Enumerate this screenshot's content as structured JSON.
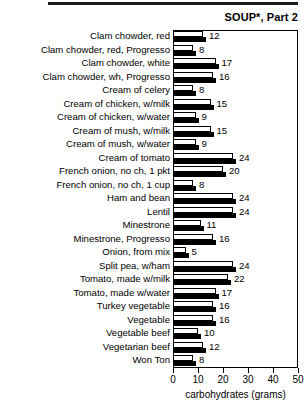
{
  "chart_title": "SOUP*, Part 2",
  "axis": {
    "x_title": "carbohydrates (grams)",
    "ticks": [
      {
        "value": 0,
        "label": "0"
      },
      {
        "value": 10,
        "label": "10"
      },
      {
        "value": 20,
        "label": "20"
      },
      {
        "value": 30,
        "label": "30"
      },
      {
        "value": 40,
        "label": "40"
      },
      {
        "value": 50,
        "label": "50"
      }
    ]
  },
  "chart_data": {
    "type": "bar",
    "orientation": "horizontal",
    "title": "SOUP*, Part 2",
    "xlabel": "carbohydrates (grams)",
    "ylabel": "",
    "xlim": [
      0,
      50
    ],
    "grid": false,
    "legend": null,
    "categories": [
      "Clam chowder, red",
      "Clam chowder, red, Progresso",
      "Clam chowder, white",
      "Clam chowder, wh, Progresso",
      "Cream of celery",
      "Cream of chicken, w/milk",
      "Cream of chicken, w/water",
      "Cream of mush, w/milk",
      "Cream of mush, w/water",
      "Cream of tomato",
      "French onion, no ch, 1 pkt",
      "French onion, no ch, 1 cup",
      "Ham and bean",
      "Lentil",
      "Minestrone",
      "Minestrone, Progresso",
      "Onion, from mix",
      "Split pea, w/ham",
      "Tomato, made w/milk",
      "Tomato, made w/water",
      "Turkey vegetable",
      "Vegetable",
      "Vegetable beef",
      "Vegetarian beef",
      "Won Ton"
    ],
    "values": [
      12,
      8,
      17,
      16,
      8,
      15,
      9,
      15,
      9,
      24,
      20,
      8,
      24,
      24,
      11,
      16,
      5,
      24,
      22,
      17,
      16,
      16,
      10,
      12,
      8
    ],
    "value_labels": [
      "12",
      "8",
      "17",
      "16",
      "8",
      "15",
      "9",
      "15",
      "9",
      "24",
      "20",
      "8",
      "24",
      "24",
      "11",
      "16",
      "5",
      "24",
      "22",
      "17",
      "16",
      "16",
      "10",
      "12",
      "8"
    ]
  }
}
